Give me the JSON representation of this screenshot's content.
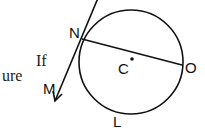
{
  "text_fragments": [
    {
      "id": "if",
      "text": "If"
    },
    {
      "id": "ure",
      "text": "ure"
    }
  ],
  "diagram": {
    "circle": {
      "center_label": "C"
    },
    "points": {
      "N": "N",
      "O": "O",
      "M": "M",
      "L": "L"
    },
    "elements": [
      "circle with center C",
      "chord NO",
      "tangent line at N with arrow toward M"
    ]
  }
}
